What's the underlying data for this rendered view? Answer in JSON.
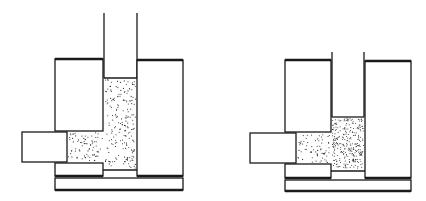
{
  "figure": {
    "colors": {
      "stroke": "#1a1a1a",
      "background": "#ffffff",
      "powder_dot": "#2a2a2a"
    },
    "panels": [
      {
        "id": "before",
        "label": "",
        "powder_state": "loose",
        "powder_density_relative": 0.4
      },
      {
        "id": "after",
        "label": "",
        "powder_state": "compacted-column",
        "powder_density_relative": 1.0
      }
    ]
  }
}
